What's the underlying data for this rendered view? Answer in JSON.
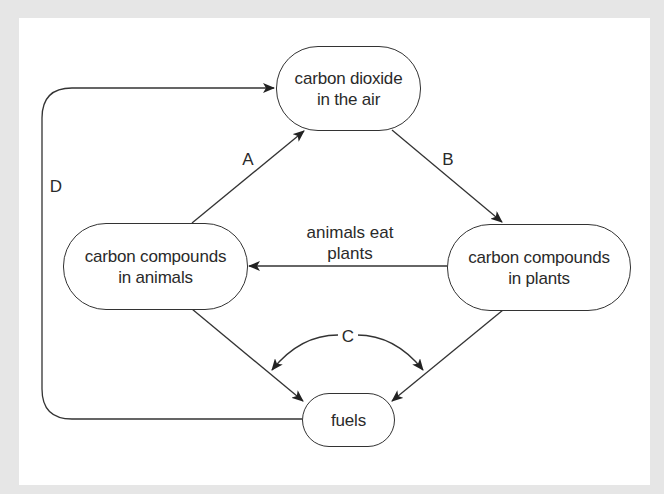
{
  "diagram": {
    "nodes": {
      "air": {
        "line1": "carbon dioxide",
        "line2": "in the air"
      },
      "animals": {
        "line1": "carbon compounds",
        "line2": "in animals"
      },
      "plants": {
        "line1": "carbon compounds",
        "line2": "in plants"
      },
      "fuels": {
        "line1": "fuels"
      }
    },
    "edges": {
      "A": {
        "label": "A",
        "from": "carbon compounds in animals",
        "to": "carbon dioxide in the air"
      },
      "B": {
        "label": "B",
        "from": "carbon dioxide in the air",
        "to": "carbon compounds in plants"
      },
      "C": {
        "label": "C",
        "from": "carbon compounds in animals / carbon compounds in plants",
        "to": "fuels"
      },
      "D": {
        "label": "D",
        "from": "fuels",
        "to": "carbon dioxide in the air"
      },
      "eat": {
        "line1": "animals eat",
        "line2": "plants",
        "from": "carbon compounds in plants",
        "to": "carbon compounds in animals"
      }
    },
    "colors": {
      "background": "#e6e6e6",
      "panel": "#ffffff",
      "stroke": "#333333",
      "text": "#2a2a2a"
    }
  }
}
